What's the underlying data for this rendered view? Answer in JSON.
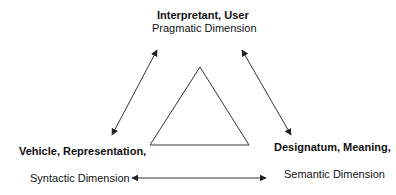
{
  "nodes": {
    "top": {
      "title": "Interpretant, User",
      "subtitle": "Pragmatic Dimension"
    },
    "left": {
      "title": "Vehicle, Representation,",
      "subtitle": "Syntactic Dimension"
    },
    "right": {
      "title": "Designatum, Meaning,",
      "subtitle": "Semantic Dimension"
    }
  },
  "center_shape": "triangle",
  "edges": [
    {
      "from": "left",
      "to": "top",
      "type": "bidirectional-arrow"
    },
    {
      "from": "top",
      "to": "right",
      "type": "bidirectional-arrow"
    },
    {
      "from": "left",
      "to": "right",
      "type": "bidirectional-arrow"
    }
  ],
  "colors": {
    "line": "#333333",
    "text": "#111111"
  }
}
